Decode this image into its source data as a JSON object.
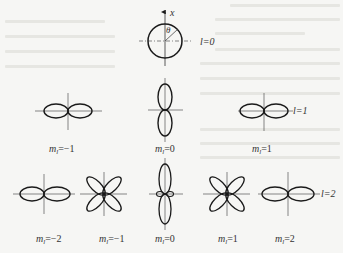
{
  "figure": {
    "axis_label": "x",
    "angle_label": "θ",
    "rows": [
      {
        "l_label": "l=0",
        "plots": [
          {
            "m_label_sym": "",
            "m_label_val": "",
            "shape": "circle"
          }
        ]
      },
      {
        "l_label": "l=1",
        "plots": [
          {
            "m_label_sym": "m",
            "m_label_sub": "l",
            "m_label_val": "=−1",
            "shape": "horizontal-two-lobe"
          },
          {
            "m_label_sym": "m",
            "m_label_sub": "l",
            "m_label_val": "=0",
            "shape": "vertical-two-lobe"
          },
          {
            "m_label_sym": "m",
            "m_label_sub": "l",
            "m_label_val": "=1",
            "shape": "horizontal-two-lobe"
          }
        ]
      },
      {
        "l_label": "l=2",
        "plots": [
          {
            "m_label_sym": "m",
            "m_label_sub": "l",
            "m_label_val": "=−2",
            "shape": "horizontal-two-lobe"
          },
          {
            "m_label_sym": "m",
            "m_label_sub": "l",
            "m_label_val": "=−1",
            "shape": "four-leaf"
          },
          {
            "m_label_sym": "m",
            "m_label_sub": "l",
            "m_label_val": "=0",
            "shape": "vertical-two-lobe-with-torus"
          },
          {
            "m_label_sym": "m",
            "m_label_sub": "l",
            "m_label_val": "=1",
            "shape": "four-leaf"
          },
          {
            "m_label_sym": "m",
            "m_label_sub": "l",
            "m_label_val": "=2",
            "shape": "horizontal-two-lobe"
          }
        ]
      }
    ]
  },
  "colors": {
    "stroke": "#1a1a1a",
    "axis": "#555555",
    "background": "#f6f6f4"
  }
}
